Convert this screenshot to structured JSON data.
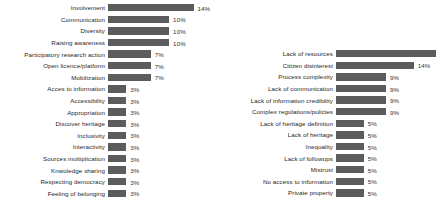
{
  "chart_data": [
    {
      "type": "bar",
      "orientation": "horizontal",
      "title": "",
      "xlabel": "",
      "ylabel": "",
      "xlim": [
        0,
        18
      ],
      "grid": false,
      "legend": false,
      "bar_color": "#5c5c5c",
      "panel": "left",
      "categories": [
        "Involvement",
        "Communication",
        "Diversity",
        "Raising awareness",
        "Participatory research action",
        "Open licence/platform",
        "Mobilization",
        "Acces to information",
        "Accessibility",
        "Appropriation",
        "Discover heritage",
        "Inclusivity",
        "Interactivity",
        "Sources multiplication",
        "Knwoledge sharing",
        "Respecting democracy",
        "Feeling of belonging"
      ],
      "values": [
        14,
        10,
        10,
        10,
        7,
        7,
        7,
        3,
        3,
        3,
        3,
        3,
        3,
        3,
        3,
        3,
        3
      ],
      "data_labels": [
        "14%",
        "10%",
        "10%",
        "10%",
        "7%",
        "7%",
        "7%",
        "3%",
        "3%",
        "3%",
        "3%",
        "3%",
        "3%",
        "3%",
        "3%",
        "3%",
        "3%"
      ]
    },
    {
      "type": "bar",
      "orientation": "horizontal",
      "title": "",
      "xlabel": "",
      "ylabel": "",
      "xlim": [
        0,
        18
      ],
      "grid": false,
      "legend": false,
      "bar_color": "#5c5c5c",
      "panel": "right",
      "categories": [
        "Lack of resources",
        "Citizen disinterest",
        "Process complexity",
        "Lack of communication",
        "Lack of information credibility",
        "Complex regulations/policies",
        "Lack of heritage definition",
        "Lack of heritage",
        "Inequality",
        "Lack of followups",
        "Mistrust",
        "No access to information",
        "Private property"
      ],
      "values": [
        18,
        14,
        9,
        9,
        9,
        9,
        5,
        5,
        5,
        5,
        5,
        5,
        5
      ],
      "data_labels": [
        "18%",
        "14%",
        "9%",
        "9%",
        "9%",
        "9%",
        "5%",
        "5%",
        "5%",
        "5%",
        "5%",
        "5%",
        "5%"
      ]
    }
  ]
}
